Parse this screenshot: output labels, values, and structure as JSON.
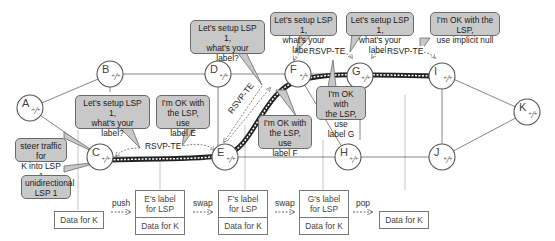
{
  "nodes": [
    {
      "id": "A",
      "label": "A"
    },
    {
      "id": "B",
      "label": "B"
    },
    {
      "id": "C",
      "label": "C"
    },
    {
      "id": "D",
      "label": "D"
    },
    {
      "id": "E",
      "label": "E"
    },
    {
      "id": "F",
      "label": "F"
    },
    {
      "id": "G",
      "label": "G"
    },
    {
      "id": "H",
      "label": "H"
    },
    {
      "id": "I",
      "label": "I"
    },
    {
      "id": "J",
      "label": "J"
    },
    {
      "id": "K",
      "label": "K"
    }
  ],
  "callouts": {
    "c_setup": [
      "Let's setup LSP 1,",
      "what's your",
      "label?"
    ],
    "e_ok": [
      "I'm OK with",
      "the LSP, use",
      "label E"
    ],
    "e_setup": [
      "Let's setup LSP 1,",
      "what's your",
      "label?"
    ],
    "f_ok": [
      "I'm OK with",
      "the LSP, use",
      "label F"
    ],
    "f_setup": [
      "Let's setup LSP 1,",
      "what's your label?"
    ],
    "g_ok": [
      "I'm OK with",
      "the LSP, use",
      "label G"
    ],
    "g_setup": [
      "Let's setup LSP 1,",
      "what's your label?"
    ],
    "i_ok": [
      "I'm OK with the LSP,",
      "use implicit null"
    ],
    "steer": [
      "steer traffic for",
      "K into LSP 1"
    ],
    "unidir": [
      "unidirectional",
      "LSP 1"
    ]
  },
  "rsvp_label": "RSVP-TE",
  "packets": {
    "ingress": "Data for K",
    "after_push": {
      "label": [
        "E's label",
        "for LSP"
      ],
      "data": "Data for K"
    },
    "after_swap1": {
      "label": [
        "F's label",
        "for LSP"
      ],
      "data": "Data for K"
    },
    "after_swap2": {
      "label": [
        "G's label",
        "for LSP"
      ],
      "data": "Data for K"
    },
    "egress": "Data for K"
  },
  "operations": {
    "push": "push",
    "swap1": "swap",
    "swap2": "swap",
    "pop": "pop"
  },
  "colors": {
    "callout_fill": "#c8c8c8",
    "lsp_line": "#222222",
    "link": "#777777"
  }
}
